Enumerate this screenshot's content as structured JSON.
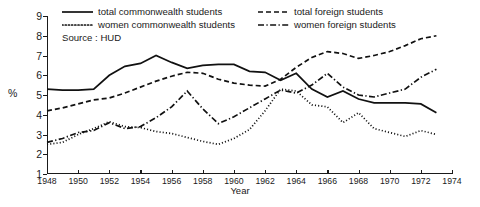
{
  "chart_data": {
    "type": "line",
    "title": "",
    "xlabel": "Year",
    "ylabel": "%",
    "source_note": "Source : HUD",
    "xlim": [
      1948,
      1974
    ],
    "ylim": [
      1,
      9
    ],
    "grid": false,
    "legend_position": "top-inside",
    "x_ticks": [
      1948,
      1950,
      1952,
      1954,
      1956,
      1958,
      1960,
      1962,
      1964,
      1966,
      1968,
      1970,
      1972,
      1974
    ],
    "y_ticks": [
      1,
      2,
      3,
      4,
      5,
      6,
      7,
      8,
      9
    ],
    "x": [
      1948,
      1949,
      1950,
      1951,
      1952,
      1953,
      1954,
      1955,
      1956,
      1957,
      1958,
      1959,
      1960,
      1961,
      1962,
      1963,
      1964,
      1965,
      1966,
      1967,
      1968,
      1969,
      1970,
      1971,
      1972,
      1973
    ],
    "series": [
      {
        "name": "total commonwealth students",
        "style": "solid",
        "values": [
          5.3,
          5.25,
          5.25,
          5.3,
          6.0,
          6.45,
          6.6,
          7.0,
          6.65,
          6.35,
          6.5,
          6.55,
          6.55,
          6.2,
          6.15,
          5.75,
          6.1,
          5.3,
          4.9,
          5.2,
          4.8,
          4.6,
          4.6,
          4.6,
          4.55,
          4.1
        ]
      },
      {
        "name": "women commonwealth students",
        "style": "dotted",
        "values": [
          2.5,
          2.6,
          3.0,
          3.3,
          3.65,
          3.4,
          3.35,
          3.15,
          3.05,
          2.85,
          2.65,
          2.5,
          2.8,
          3.25,
          4.2,
          5.3,
          5.2,
          4.5,
          4.4,
          3.6,
          4.1,
          3.3,
          3.1,
          2.9,
          3.2,
          3.0
        ]
      },
      {
        "name": "total foreign students",
        "style": "dashed",
        "values": [
          4.2,
          4.35,
          4.55,
          4.75,
          4.85,
          5.1,
          5.4,
          5.7,
          5.95,
          6.15,
          6.1,
          5.8,
          5.6,
          5.5,
          5.45,
          5.8,
          6.4,
          6.9,
          7.2,
          7.1,
          6.85,
          7.0,
          7.2,
          7.5,
          7.85,
          8.0
        ]
      },
      {
        "name": "women foreign students",
        "style": "dashdot",
        "values": [
          2.6,
          2.8,
          3.1,
          3.2,
          3.6,
          3.3,
          3.4,
          3.85,
          4.4,
          5.2,
          4.3,
          3.55,
          3.9,
          4.35,
          4.8,
          5.25,
          5.1,
          5.5,
          6.1,
          5.4,
          5.0,
          4.9,
          5.1,
          5.3,
          5.9,
          6.3
        ]
      }
    ]
  },
  "legend": {
    "left_items": [
      {
        "label": "total commonwealth students",
        "style": "solid"
      },
      {
        "label": "women commonwealth students",
        "style": "dotted"
      }
    ],
    "right_items": [
      {
        "label": "total foreign students",
        "style": "dashed"
      },
      {
        "label": "women foreign students",
        "style": "dashdot"
      }
    ]
  },
  "axis": {
    "y_title": "%",
    "x_title": "Year",
    "y_tick_labels": [
      "9",
      "8",
      "7",
      "6",
      "5",
      "4",
      "3",
      "2",
      "1"
    ],
    "x_tick_labels": [
      "1948",
      "1950",
      "1952",
      "1954",
      "1956",
      "1958",
      "1960",
      "1962",
      "1964",
      "1966",
      "1968",
      "1970",
      "1972",
      "1974"
    ]
  },
  "colors": {
    "ink": "#1a1a1a",
    "background": "#ffffff"
  }
}
